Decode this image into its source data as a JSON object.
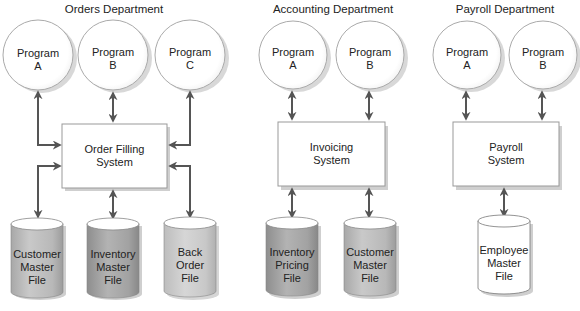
{
  "diagram": {
    "type": "file-processing-system",
    "colors": {
      "arrow": "#555555",
      "box_border": "#999999",
      "box_shadow": "#c8c8c8",
      "circle_border": "#aaaaaa",
      "cylinder_gray": "#b5b5b5",
      "cylinder_dark": "#9a9a9a",
      "cylinder_white": "#ffffff"
    },
    "departments": [
      {
        "title": "Orders Department",
        "programs": [
          {
            "label": "Program\nA"
          },
          {
            "label": "Program\nB"
          },
          {
            "label": "Program\nC"
          }
        ],
        "system": {
          "label": "Order Filling\nSystem"
        },
        "files": [
          {
            "label": "Customer\nMaster\nFile",
            "shade": "gray"
          },
          {
            "label": "Inventory\nMaster\nFile",
            "shade": "dark"
          },
          {
            "label": "Back\nOrder\nFile",
            "shade": "light"
          }
        ]
      },
      {
        "title": "Accounting Department",
        "programs": [
          {
            "label": "Program\nA"
          },
          {
            "label": "Program\nB"
          }
        ],
        "system": {
          "label": "Invoicing\nSystem"
        },
        "files": [
          {
            "label": "Inventory\nPricing\nFile",
            "shade": "dark"
          },
          {
            "label": "Customer\nMaster\nFile",
            "shade": "gray"
          }
        ]
      },
      {
        "title": "Payroll Department",
        "programs": [
          {
            "label": "Program\nA"
          },
          {
            "label": "Program\nB"
          }
        ],
        "system": {
          "label": "Payroll\nSystem"
        },
        "files": [
          {
            "label": "Employee\nMaster\nFile",
            "shade": "white"
          }
        ]
      }
    ]
  }
}
